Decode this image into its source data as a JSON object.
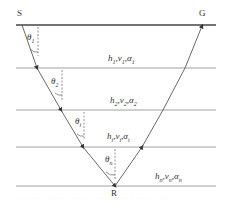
{
  "diagram": {
    "type": "layered-media ray path",
    "points": {
      "source": "S",
      "receiver_surface": "G",
      "reflection_point": "R"
    },
    "layers": [
      {
        "label": "h1,v1,α1",
        "h": "h",
        "h_sub": "1",
        "v": "v",
        "v_sub": "1",
        "a": "α",
        "a_sub": "1"
      },
      {
        "label": "h2,v2,α2",
        "h": "h",
        "h_sub": "2",
        "v": "v",
        "v_sub": "2",
        "a": "α",
        "a_sub": "2"
      },
      {
        "label": "hi,vi,αi",
        "h": "h",
        "h_sub": "i",
        "v": "v",
        "v_sub": "i",
        "a": "α",
        "a_sub": "i"
      },
      {
        "label": "hn,vn,αn",
        "h": "h",
        "h_sub": "n",
        "v": "v",
        "v_sub": "n",
        "a": "α",
        "a_sub": "n"
      }
    ],
    "angles": [
      {
        "sym": "θ",
        "sub": "1"
      },
      {
        "sym": "θ",
        "sub": "2"
      },
      {
        "sym": "θ",
        "sub": "i"
      },
      {
        "sym": "θ",
        "sub": "n"
      }
    ],
    "colors": {
      "lines": "#555555",
      "ray": "#444444",
      "text": "#333333"
    },
    "caption": "(illegible caption)"
  }
}
